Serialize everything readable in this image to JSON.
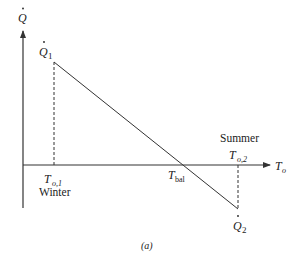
{
  "diagram": {
    "y_axis_label": "Q",
    "x_axis_label": "T",
    "x_axis_sub": "o",
    "point_1": {
      "label": "Q",
      "sub": "1",
      "x_label": "T",
      "x_sub": "o,1",
      "season": "Winter"
    },
    "point_2": {
      "label": "Q",
      "sub": "2",
      "x_label": "T",
      "x_sub": "o,2",
      "season": "Summer"
    },
    "balance": {
      "label": "T",
      "sub": "bal"
    },
    "caption": "(a)"
  },
  "colors": {
    "line": "#333333",
    "text": "#222222"
  }
}
